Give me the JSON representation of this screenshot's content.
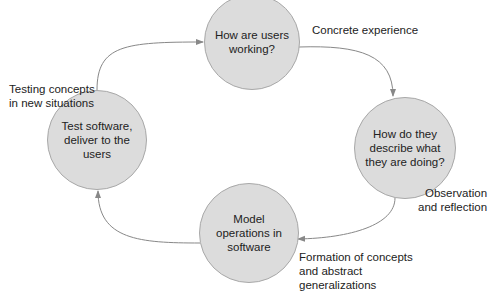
{
  "diagram": {
    "type": "cycle",
    "nodes": [
      {
        "id": "top",
        "text": "How are users working?",
        "lines": [
          "How are users",
          "working?"
        ]
      },
      {
        "id": "right",
        "text": "How do they describe what they are doing?",
        "lines": [
          "How do they",
          "describe what",
          "they are doing?"
        ]
      },
      {
        "id": "bottom",
        "text": "Model operations in software",
        "lines": [
          "Model",
          "operations in",
          "software"
        ]
      },
      {
        "id": "left",
        "text": "Test software, deliver to the users",
        "lines": [
          "Test software,",
          "deliver to the",
          "users"
        ]
      }
    ],
    "edge_labels": [
      {
        "id": "concrete",
        "lines": [
          "Concrete experience"
        ]
      },
      {
        "id": "observation",
        "lines": [
          "Observation",
          "and reflection"
        ]
      },
      {
        "id": "formation",
        "lines": [
          "Formation of concepts",
          "and abstract",
          "generalizations"
        ]
      },
      {
        "id": "testing",
        "lines": [
          "Testing concepts",
          "in new situations"
        ]
      }
    ],
    "edges": [
      {
        "from": "top",
        "to": "right"
      },
      {
        "from": "right",
        "to": "bottom"
      },
      {
        "from": "bottom",
        "to": "left"
      },
      {
        "from": "left",
        "to": "top"
      }
    ],
    "colors": {
      "node_fill": "#dcdcdc",
      "node_stroke": "#a8a8a8",
      "edge": "#888888"
    }
  }
}
